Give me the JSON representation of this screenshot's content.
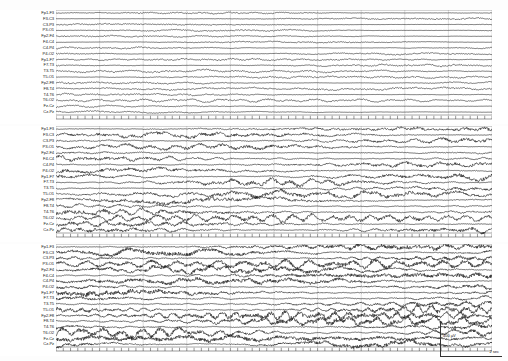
{
  "recording": {
    "title": "Scalp EEG — longitudinal bipolar montage",
    "block_count": 3,
    "channels_per_block": 18,
    "trace_color": "#111111",
    "background_color": "#ffffff",
    "grid_color": "#888888"
  },
  "montage": {
    "name": "double-banana",
    "channels": [
      "Fp1-F3",
      "F3-C3",
      "C3-P3",
      "P3-O1",
      "Fp2-F4",
      "F4-C4",
      "C4-P4",
      "P4-O2",
      "Fp1-F7",
      "F7-T3",
      "T3-T5",
      "T5-O1",
      "Fp2-F8",
      "F8-T4",
      "T4-T6",
      "T6-O2",
      "Fz-Cz",
      "Cz-Pz"
    ]
  },
  "blocks": [
    {
      "index": 1,
      "amplitude_scale": 0.42,
      "density": 1.0,
      "description": "low amplitude mixed frequency background"
    },
    {
      "index": 2,
      "amplitude_scale": 1.0,
      "density": 1.55,
      "description": "evolving rhythmic higher amplitude activity"
    },
    {
      "index": 3,
      "amplitude_scale": 1.25,
      "density": 1.95,
      "description": "maximal amplitude fast rhythmic discharge"
    }
  ],
  "calibration": {
    "voltage_label": "400 µV",
    "time_label": "2 sec"
  },
  "timebar": {
    "tick_count": 60,
    "label": "timing-ticks"
  }
}
